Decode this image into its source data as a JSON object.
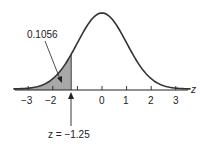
{
  "chart_data": {
    "type": "area",
    "title": "",
    "xlabel": "z",
    "ylabel": "",
    "x_ticks": [
      -3,
      -2,
      -1,
      0,
      1,
      2,
      3
    ],
    "tick_labels": [
      "−3",
      "−2",
      "",
      "0",
      "1",
      "2",
      "3"
    ],
    "xlim": [
      -3.6,
      3.6
    ],
    "distribution": "standard normal",
    "shaded_region": {
      "from": "-inf",
      "to": -1.25,
      "area": 0.1056
    },
    "annotations": [
      {
        "text": "0.1056",
        "points_to": "shaded left tail"
      },
      {
        "text": "z = −1.25",
        "points_to": "z = -1.25 on axis"
      }
    ],
    "colors": {
      "curve": "#333333",
      "shade": "#a8a8a8",
      "axis": "#222222"
    }
  },
  "labels": {
    "area": "0.1056",
    "zvalue": "z = −1.25",
    "axis_var": "z",
    "t_m3": "−3",
    "t_m2": "−2",
    "t_0": "0",
    "t_1": "1",
    "t_2": "2",
    "t_3": "3"
  }
}
